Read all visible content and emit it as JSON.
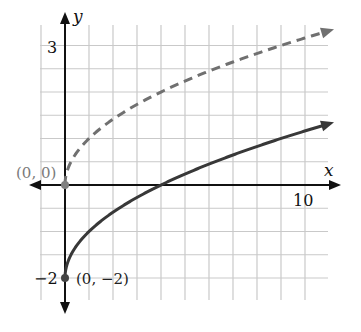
{
  "chart_data": {
    "type": "line",
    "title": "",
    "xlabel": "x",
    "ylabel": "y",
    "xlim": [
      -1,
      11
    ],
    "ylim": [
      -2.5,
      3.5
    ],
    "grid": true,
    "grid_step_x": 1,
    "grid_step_y": 0.5,
    "x_tick_labels": [
      {
        "value": 10,
        "label": "10"
      }
    ],
    "y_tick_labels": [
      {
        "value": 3,
        "label": "3"
      },
      {
        "value": -2,
        "label": "−2"
      }
    ],
    "series": [
      {
        "name": "y = √x",
        "style": "dashed",
        "color": "#707070",
        "x": [
          0,
          1,
          2,
          4,
          6,
          9,
          11
        ],
        "values": [
          0,
          1,
          1.41,
          2,
          2.45,
          3,
          3.32
        ]
      },
      {
        "name": "y = √x − 2",
        "style": "solid",
        "color": "#383838",
        "x": [
          0,
          1,
          2,
          4,
          6,
          9,
          11
        ],
        "values": [
          -2,
          -1,
          -0.59,
          0,
          0.45,
          1,
          1.32
        ]
      }
    ],
    "annotations": [
      {
        "text": "(0, 0)",
        "x": 0,
        "y": 0
      },
      {
        "text": "(0, −2)",
        "x": 0,
        "y": -2
      }
    ]
  },
  "labels": {
    "x_axis": "x",
    "y_axis": "y",
    "tick_x_10": "10",
    "tick_y_3": "3",
    "tick_y_neg2": "−2",
    "point_origin": "(0, 0)",
    "point_start": "(0, −2)"
  },
  "colors": {
    "grid": "#c9c9c9",
    "axis": "#111111",
    "dashed_curve": "#707070",
    "solid_curve": "#383838",
    "origin_label": "#7a7a7a"
  }
}
